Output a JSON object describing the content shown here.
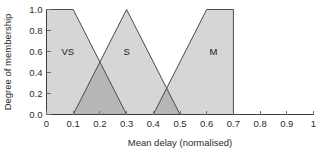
{
  "chart_data": {
    "type": "area",
    "title": "",
    "xlabel": "Mean delay (normalised)",
    "ylabel": "Degree of membership",
    "xlim": [
      0,
      1
    ],
    "ylim": [
      0,
      1
    ],
    "grid": false,
    "legend": "none",
    "x_ticks": [
      "0",
      "0.1",
      "0.2",
      "0.3",
      "0.4",
      "0.5",
      "0.6",
      "0.7",
      "0.8",
      "0.9",
      "1"
    ],
    "x_tick_values": [
      0,
      0.1,
      0.2,
      0.3,
      0.4,
      0.5,
      0.6,
      0.7,
      0.8,
      0.9,
      1
    ],
    "y_ticks": [
      "0.0",
      "0.2",
      "0.4",
      "0.6",
      "0.8",
      "1.0"
    ],
    "y_tick_values": [
      0,
      0.2,
      0.4,
      0.6,
      0.8,
      1
    ],
    "fill_color": "#d6d6d6",
    "overlap_color": "#b6b6b6",
    "line_color": "#4a4a4a",
    "series": [
      {
        "name": "VS",
        "label": "VS",
        "shape": "trapezoid",
        "points": [
          [
            0,
            0
          ],
          [
            0,
            1
          ],
          [
            0.1,
            1
          ],
          [
            0.3,
            0
          ],
          [
            0,
            0
          ]
        ],
        "label_x": 0.08,
        "label_y": 0.6
      },
      {
        "name": "S",
        "label": "S",
        "shape": "triangle",
        "points": [
          [
            0.1,
            0
          ],
          [
            0.3,
            1
          ],
          [
            0.5,
            0
          ],
          [
            0.1,
            0
          ]
        ],
        "label_x": 0.3,
        "label_y": 0.6
      },
      {
        "name": "M",
        "label": "M",
        "shape": "trapezoid",
        "points": [
          [
            0.4,
            0
          ],
          [
            0.6,
            1
          ],
          [
            0.7,
            1
          ],
          [
            0.7,
            0
          ],
          [
            0.4,
            0
          ]
        ],
        "label_x": 0.625,
        "label_y": 0.6
      }
    ],
    "overlaps": [
      {
        "name": "VS-S overlap",
        "between": [
          "VS",
          "S"
        ],
        "points": [
          [
            0.1,
            0
          ],
          [
            0.2,
            0.5
          ],
          [
            0.3,
            0
          ],
          [
            0.1,
            0
          ]
        ],
        "peak": [
          0.2,
          0.5
        ]
      },
      {
        "name": "S-M overlap",
        "between": [
          "S",
          "M"
        ],
        "points": [
          [
            0.4,
            0
          ],
          [
            0.45,
            0.25
          ],
          [
            0.5,
            0
          ],
          [
            0.4,
            0
          ]
        ],
        "peak": [
          0.45,
          0.25
        ]
      }
    ]
  }
}
